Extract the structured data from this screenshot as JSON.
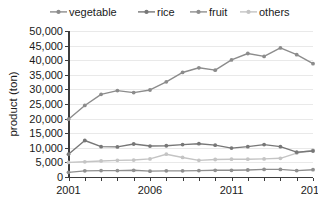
{
  "chart_data": {
    "type": "line",
    "title": "",
    "xlabel": "",
    "ylabel": "product (ton)",
    "x": [
      2001,
      2002,
      2003,
      2004,
      2005,
      2006,
      2007,
      2008,
      2009,
      2010,
      2011,
      2012,
      2013,
      2014,
      2015,
      2016
    ],
    "xtick_labels": [
      "2001",
      "2006",
      "2011",
      "2016"
    ],
    "xtick_values": [
      2001,
      2006,
      2011,
      2016
    ],
    "xlim": [
      2001,
      2016
    ],
    "ytick_labels": [
      "0",
      "5,000",
      "10,000",
      "15,000",
      "20,000",
      "25,000",
      "30,000",
      "35,000",
      "40,000",
      "45,000",
      "50,000"
    ],
    "ytick_values": [
      0,
      5000,
      10000,
      15000,
      20000,
      25000,
      30000,
      35000,
      40000,
      45000,
      50000
    ],
    "ylim": [
      0,
      50000
    ],
    "grid": "horizontal",
    "legend_position": "top",
    "series": [
      {
        "name": "vegetable",
        "color": "#8c8c8c",
        "marker": "circle",
        "values": [
          19800,
          24500,
          28300,
          29600,
          28900,
          29800,
          32600,
          35800,
          37400,
          36600,
          40100,
          42300,
          41300,
          44200,
          41900,
          38800
        ]
      },
      {
        "name": "rice",
        "color": "#777777",
        "marker": "circle",
        "values": [
          7800,
          12500,
          10400,
          10300,
          11300,
          10600,
          10700,
          11100,
          11400,
          10900,
          9900,
          10400,
          11100,
          10400,
          8500,
          8900
        ]
      },
      {
        "name": "fruit",
        "color": "#8f8f8f",
        "marker": "circle",
        "values": [
          1600,
          2100,
          2200,
          2200,
          2300,
          2000,
          2100,
          2100,
          2200,
          2300,
          2300,
          2400,
          2600,
          2600,
          2200,
          2500
        ]
      },
      {
        "name": "others",
        "color": "#c4c4c4",
        "marker": "circle",
        "values": [
          5000,
          5200,
          5500,
          5700,
          5800,
          6200,
          7800,
          6700,
          5700,
          6000,
          6100,
          6100,
          6200,
          6400,
          8200,
          9200
        ]
      }
    ]
  },
  "legend": {
    "items": [
      {
        "label": "vegetable"
      },
      {
        "label": "rice"
      },
      {
        "label": "fruit"
      },
      {
        "label": "others"
      }
    ]
  },
  "axes": {
    "y_title": "product (ton)"
  }
}
